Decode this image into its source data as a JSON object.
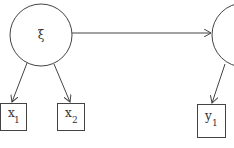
{
  "diagram": {
    "type": "path-diagram",
    "colors": {
      "stroke": "#444444",
      "text": "#333333",
      "background": "#ffffff"
    },
    "nodes": [
      {
        "id": "xi",
        "shape": "circle",
        "label": "ξ"
      },
      {
        "id": "eta",
        "shape": "circle",
        "label": ""
      },
      {
        "id": "x1",
        "shape": "rect",
        "label": "x",
        "subscript": "1"
      },
      {
        "id": "x2",
        "shape": "rect",
        "label": "x",
        "subscript": "2"
      },
      {
        "id": "y1",
        "shape": "rect",
        "label": "y",
        "subscript": "1"
      }
    ],
    "edges": [
      {
        "from": "xi",
        "to": "eta"
      },
      {
        "from": "xi",
        "to": "x1"
      },
      {
        "from": "xi",
        "to": "x2"
      },
      {
        "from": "eta",
        "to": "y1"
      }
    ]
  }
}
